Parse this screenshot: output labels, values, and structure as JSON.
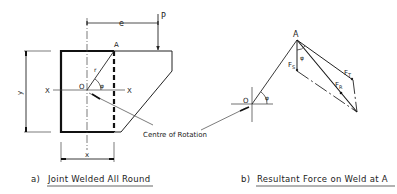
{
  "figure_a": {
    "caption_prefix": "a)",
    "caption": "Joint Welded All Round",
    "labels": {
      "e": "e",
      "P": "P",
      "A": "A",
      "r": "r",
      "O": "O",
      "phi": "φ",
      "X_left": "X",
      "X_right": "X",
      "y": "y",
      "x": "x"
    },
    "annotation": "Centre of Rotation"
  },
  "figure_b": {
    "caption_prefix": "b)",
    "caption": "Resultant Force on Weld at A",
    "labels": {
      "A": "A",
      "O": "O",
      "phi_at_O": "φ",
      "phi_at_A": "φ",
      "F_S": "F",
      "F_S_sub": "S",
      "F_T": "F",
      "F_T_sub": "T",
      "F_R": "F",
      "F_R_sub": "R"
    }
  },
  "colors": {
    "line": "#222222",
    "background": "#ffffff"
  }
}
